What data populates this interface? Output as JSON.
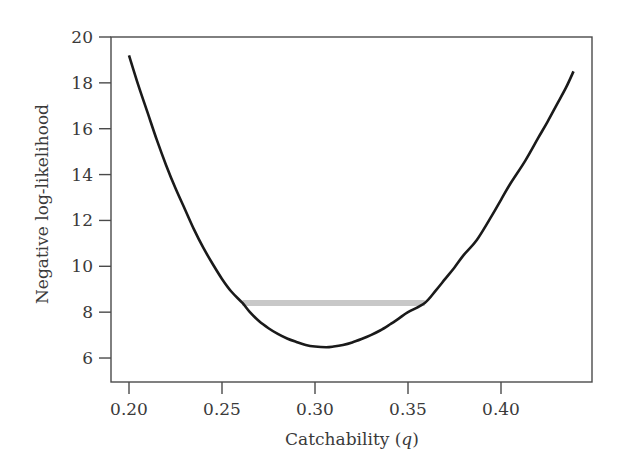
{
  "chart_data": {
    "type": "line",
    "title": "",
    "xlabel": "Catchability (q)",
    "xlabel_main": "Catchability (",
    "xlabel_var": "q",
    "xlabel_close": ")",
    "ylabel": "Negative log-likelihood",
    "xlim": [
      0.19,
      0.45
    ],
    "ylim": [
      5,
      20
    ],
    "x_ticks": [
      0.2,
      0.25,
      0.3,
      0.35,
      0.4
    ],
    "x_tick_labels": [
      "0.20",
      "0.25",
      "0.30",
      "0.35",
      "0.40"
    ],
    "y_ticks": [
      6,
      8,
      10,
      12,
      14,
      16,
      18,
      20
    ],
    "y_tick_labels": [
      "6",
      "8",
      "10",
      "12",
      "14",
      "16",
      "18",
      "20"
    ],
    "grid": false,
    "legend": null,
    "series": [
      {
        "name": "Negative log-likelihood profile",
        "color": "#1a1a1a",
        "x": [
          0.2,
          0.205,
          0.21,
          0.215,
          0.22,
          0.225,
          0.23,
          0.235,
          0.24,
          0.245,
          0.25,
          0.255,
          0.261,
          0.265,
          0.27,
          0.275,
          0.28,
          0.285,
          0.29,
          0.295,
          0.3,
          0.306,
          0.31,
          0.315,
          0.32,
          0.325,
          0.33,
          0.335,
          0.34,
          0.345,
          0.35,
          0.359,
          0.365,
          0.37,
          0.375,
          0.38,
          0.387,
          0.395,
          0.4,
          0.405,
          0.413,
          0.42,
          0.425,
          0.43,
          0.435,
          0.439
        ],
        "y": [
          19.2,
          17.9,
          16.7,
          15.5,
          14.4,
          13.4,
          12.5,
          11.6,
          10.8,
          10.1,
          9.45,
          8.9,
          8.4,
          8.0,
          7.6,
          7.3,
          7.05,
          6.85,
          6.7,
          6.57,
          6.5,
          6.47,
          6.5,
          6.57,
          6.68,
          6.83,
          7.0,
          7.2,
          7.45,
          7.72,
          8.0,
          8.4,
          8.95,
          9.45,
          9.95,
          10.5,
          11.15,
          12.2,
          12.9,
          13.6,
          14.6,
          15.6,
          16.3,
          17.05,
          17.8,
          18.5
        ]
      }
    ],
    "annotations": [
      {
        "type": "horizontal-segment",
        "description": "Likelihood-profile confidence interval",
        "color": "#c8c8c8",
        "y": 8.4,
        "x_start": 0.261,
        "x_end": 0.359
      }
    ],
    "minimum": {
      "x": 0.306,
      "y": 6.47
    }
  }
}
